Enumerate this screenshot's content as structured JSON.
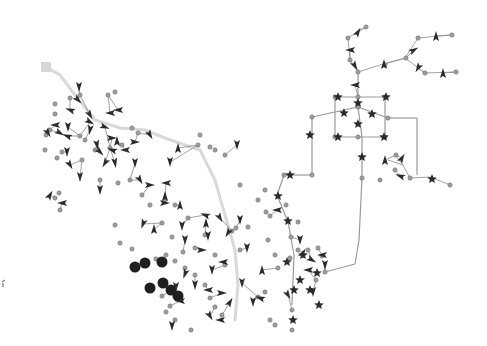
{
  "diagram": {
    "type": "network-graph",
    "background": "#ffffff",
    "colors": {
      "trunk": "#d9d9d9",
      "edge": "#8a8a8a",
      "junction": "#9c9c9c",
      "marker": "#2b2b2b",
      "root": "#d6d6d6"
    },
    "root": {
      "shape": "square",
      "x": 46,
      "y": 67,
      "size": 10
    },
    "trunks": [
      [
        [
          46,
          67
        ],
        [
          60,
          75
        ],
        [
          75,
          95
        ],
        [
          95,
          120
        ],
        [
          120,
          128
        ],
        [
          145,
          130
        ],
        [
          165,
          138
        ],
        [
          185,
          145
        ],
        [
          200,
          150
        ]
      ],
      [
        [
          200,
          150
        ],
        [
          215,
          180
        ],
        [
          225,
          215
        ],
        [
          235,
          250
        ],
        [
          238,
          285
        ],
        [
          235,
          320
        ]
      ]
    ],
    "grid_edges": [
      [
        [
          358,
          72
        ],
        [
          358,
          97
        ]
      ],
      [
        [
          335,
          97
        ],
        [
          385,
          97
        ]
      ],
      [
        [
          335,
          97
        ],
        [
          335,
          137
        ]
      ],
      [
        [
          385,
          97
        ],
        [
          385,
          137
        ]
      ],
      [
        [
          335,
          137
        ],
        [
          385,
          137
        ]
      ],
      [
        [
          312,
          117
        ],
        [
          358,
          107
        ]
      ],
      [
        [
          358,
          107
        ],
        [
          388,
          118
        ]
      ],
      [
        [
          312,
          117
        ],
        [
          312,
          175
        ]
      ],
      [
        [
          388,
          118
        ],
        [
          417,
          118
        ]
      ],
      [
        [
          417,
          118
        ],
        [
          417,
          175
        ]
      ],
      [
        [
          358,
          107
        ],
        [
          362,
          137
        ]
      ],
      [
        [
          362,
          137
        ],
        [
          362,
          178
        ]
      ],
      [
        [
          362,
          178
        ],
        [
          359,
          240
        ]
      ],
      [
        [
          359,
          240
        ],
        [
          355,
          264
        ]
      ],
      [
        [
          355,
          264
        ],
        [
          325,
          272
        ]
      ],
      [
        [
          312,
          175
        ],
        [
          284,
          175
        ]
      ],
      [
        [
          284,
          175
        ],
        [
          277,
          195
        ]
      ],
      [
        [
          277,
          195
        ],
        [
          288,
          222
        ]
      ],
      [
        [
          288,
          222
        ],
        [
          294,
          255
        ]
      ],
      [
        [
          294,
          255
        ],
        [
          292,
          305
        ]
      ]
    ],
    "tree_edges": [
      [
        [
          358,
          72
        ],
        [
          350,
          60
        ]
      ],
      [
        [
          350,
          60
        ],
        [
          348,
          38
        ]
      ],
      [
        [
          348,
          38
        ],
        [
          365,
          27
        ]
      ],
      [
        [
          358,
          72
        ],
        [
          380,
          65
        ]
      ],
      [
        [
          380,
          65
        ],
        [
          405,
          58
        ]
      ],
      [
        [
          405,
          58
        ],
        [
          418,
          38
        ]
      ],
      [
        [
          418,
          38
        ],
        [
          450,
          35
        ]
      ],
      [
        [
          405,
          58
        ],
        [
          425,
          73
        ]
      ],
      [
        [
          425,
          73
        ],
        [
          456,
          72
        ]
      ],
      [
        [
          395,
          155
        ],
        [
          403,
          165
        ]
      ],
      [
        [
          403,
          165
        ],
        [
          410,
          178
        ]
      ],
      [
        [
          410,
          178
        ],
        [
          430,
          177
        ]
      ],
      [
        [
          430,
          177
        ],
        [
          450,
          185
        ]
      ],
      [
        [
          403,
          165
        ],
        [
          388,
          160
        ]
      ]
    ],
    "stars": [
      [
        338,
        97
      ],
      [
        386,
        97
      ],
      [
        358,
        103
      ],
      [
        344,
        113
      ],
      [
        372,
        114
      ],
      [
        358,
        124
      ],
      [
        310,
        135
      ],
      [
        338,
        137
      ],
      [
        384,
        137
      ],
      [
        362,
        157
      ],
      [
        290,
        175
      ],
      [
        278,
        196
      ],
      [
        288,
        221
      ],
      [
        287,
        262
      ],
      [
        294,
        290
      ],
      [
        300,
        280
      ],
      [
        310,
        290
      ],
      [
        319,
        305
      ],
      [
        293,
        320
      ],
      [
        303,
        255
      ],
      [
        317,
        273
      ],
      [
        432,
        179
      ]
    ],
    "junctions": [
      [
        350,
        60
      ],
      [
        348,
        38
      ],
      [
        366,
        27
      ],
      [
        385,
        65
      ],
      [
        406,
        58
      ],
      [
        418,
        38
      ],
      [
        452,
        35
      ],
      [
        425,
        73
      ],
      [
        456,
        72
      ],
      [
        358,
        72
      ],
      [
        358,
        97
      ],
      [
        335,
        97
      ],
      [
        385,
        97
      ],
      [
        312,
        117
      ],
      [
        358,
        107
      ],
      [
        388,
        118
      ],
      [
        358,
        137
      ],
      [
        335,
        137
      ],
      [
        385,
        137
      ],
      [
        362,
        178
      ],
      [
        312,
        175
      ],
      [
        284,
        175
      ],
      [
        286,
        205
      ],
      [
        298,
        222
      ],
      [
        291,
        237
      ],
      [
        298,
        250
      ],
      [
        290,
        258
      ],
      [
        292,
        310
      ],
      [
        292,
        330
      ],
      [
        308,
        250
      ],
      [
        318,
        248
      ],
      [
        322,
        256
      ],
      [
        316,
        280
      ],
      [
        325,
        272
      ],
      [
        380,
        180
      ],
      [
        410,
        178
      ],
      [
        450,
        185
      ],
      [
        396,
        155
      ],
      [
        395,
        170
      ],
      [
        70,
        98
      ],
      [
        55,
        104
      ],
      [
        55,
        114
      ],
      [
        50,
        130
      ],
      [
        46,
        135
      ],
      [
        45,
        150
      ],
      [
        57,
        158
      ],
      [
        62,
        152
      ],
      [
        80,
        95
      ],
      [
        108,
        95
      ],
      [
        115,
        92
      ],
      [
        80,
        136
      ],
      [
        85,
        140
      ],
      [
        82,
        160
      ],
      [
        95,
        150
      ],
      [
        110,
        148
      ],
      [
        122,
        145
      ],
      [
        132,
        128
      ],
      [
        138,
        133
      ],
      [
        210,
        147
      ],
      [
        198,
        145
      ],
      [
        215,
        150
      ],
      [
        200,
        135
      ],
      [
        225,
        155
      ],
      [
        240,
        185
      ],
      [
        265,
        190
      ],
      [
        258,
        200
      ],
      [
        266,
        212
      ],
      [
        270,
        216
      ],
      [
        268,
        240
      ],
      [
        275,
        255
      ],
      [
        278,
        268
      ],
      [
        265,
        292
      ],
      [
        258,
        297
      ],
      [
        270,
        320
      ],
      [
        275,
        325
      ],
      [
        248,
        227
      ],
      [
        236,
        228
      ],
      [
        232,
        231
      ],
      [
        240,
        250
      ],
      [
        210,
        298
      ],
      [
        162,
        223
      ],
      [
        162,
        296
      ],
      [
        115,
        225
      ],
      [
        120,
        243
      ],
      [
        132,
        249
      ],
      [
        156,
        259
      ],
      [
        166,
        255
      ],
      [
        175,
        261
      ],
      [
        185,
        268
      ],
      [
        195,
        248
      ],
      [
        205,
        235
      ],
      [
        215,
        255
      ],
      [
        225,
        265
      ],
      [
        55,
        198
      ],
      [
        60,
        210
      ],
      [
        59,
        193
      ],
      [
        100,
        180
      ],
      [
        118,
        183
      ],
      [
        130,
        180
      ],
      [
        142,
        195
      ],
      [
        150,
        205
      ],
      [
        165,
        200
      ],
      [
        175,
        205
      ],
      [
        188,
        218
      ],
      [
        172,
        237
      ],
      [
        183,
        252
      ],
      [
        195,
        275
      ],
      [
        205,
        285
      ],
      [
        215,
        307
      ],
      [
        222,
        315
      ],
      [
        166,
        312
      ],
      [
        170,
        306
      ],
      [
        175,
        320
      ],
      [
        191,
        330
      ]
    ],
    "triangles": [
      {
        "x": 79,
        "y": 87,
        "r": 90
      },
      {
        "x": 78,
        "y": 100,
        "r": 45
      },
      {
        "x": 70,
        "y": 110,
        "r": 200
      },
      {
        "x": 90,
        "y": 115,
        "r": 60
      },
      {
        "x": 90,
        "y": 122,
        "r": 30
      },
      {
        "x": 110,
        "y": 113,
        "r": 180
      },
      {
        "x": 118,
        "y": 110,
        "r": 180
      },
      {
        "x": 55,
        "y": 125,
        "r": 180
      },
      {
        "x": 68,
        "y": 127,
        "r": 90
      },
      {
        "x": 48,
        "y": 133,
        "r": 60
      },
      {
        "x": 60,
        "y": 133,
        "r": 30
      },
      {
        "x": 67,
        "y": 136,
        "r": 200
      },
      {
        "x": 90,
        "y": 130,
        "r": 100
      },
      {
        "x": 105,
        "y": 127,
        "r": 20
      },
      {
        "x": 112,
        "y": 138,
        "r": 0
      },
      {
        "x": 117,
        "y": 141,
        "r": 270
      },
      {
        "x": 97,
        "y": 145,
        "r": 80
      },
      {
        "x": 67,
        "y": 152,
        "r": 90
      },
      {
        "x": 100,
        "y": 152,
        "r": 45
      },
      {
        "x": 112,
        "y": 150,
        "r": 200
      },
      {
        "x": 125,
        "y": 150,
        "r": 180
      },
      {
        "x": 135,
        "y": 142,
        "r": 0
      },
      {
        "x": 105,
        "y": 163,
        "r": 120
      },
      {
        "x": 115,
        "y": 163,
        "r": 80
      },
      {
        "x": 70,
        "y": 165,
        "r": 60
      },
      {
        "x": 135,
        "y": 163,
        "r": 90
      },
      {
        "x": 150,
        "y": 135,
        "r": 60
      },
      {
        "x": 178,
        "y": 148,
        "r": 270
      },
      {
        "x": 170,
        "y": 162,
        "r": 90
      },
      {
        "x": 237,
        "y": 145,
        "r": 90
      },
      {
        "x": 50,
        "y": 195,
        "r": 300
      },
      {
        "x": 62,
        "y": 203,
        "r": 180
      },
      {
        "x": 80,
        "y": 177,
        "r": 90
      },
      {
        "x": 100,
        "y": 190,
        "r": 90
      },
      {
        "x": 140,
        "y": 180,
        "r": 60
      },
      {
        "x": 150,
        "y": 185,
        "r": 0
      },
      {
        "x": 166,
        "y": 183,
        "r": 180
      },
      {
        "x": 165,
        "y": 196,
        "r": 270
      },
      {
        "x": 143,
        "y": 224,
        "r": 110
      },
      {
        "x": 154,
        "y": 229,
        "r": 270
      },
      {
        "x": 165,
        "y": 203,
        "r": 0
      },
      {
        "x": 180,
        "y": 205,
        "r": 270
      },
      {
        "x": 182,
        "y": 226,
        "r": 90
      },
      {
        "x": 185,
        "y": 240,
        "r": 90
      },
      {
        "x": 205,
        "y": 215,
        "r": 200
      },
      {
        "x": 206,
        "y": 223,
        "r": 270
      },
      {
        "x": 208,
        "y": 236,
        "r": 90
      },
      {
        "x": 220,
        "y": 218,
        "r": 60
      },
      {
        "x": 228,
        "y": 233,
        "r": 120
      },
      {
        "x": 202,
        "y": 250,
        "r": 0
      },
      {
        "x": 212,
        "y": 270,
        "r": 90
      },
      {
        "x": 223,
        "y": 262,
        "r": 180
      },
      {
        "x": 222,
        "y": 293,
        "r": 0
      },
      {
        "x": 230,
        "y": 302,
        "r": 300
      },
      {
        "x": 242,
        "y": 283,
        "r": 90
      },
      {
        "x": 210,
        "y": 316,
        "r": 60
      },
      {
        "x": 220,
        "y": 320,
        "r": 180
      },
      {
        "x": 172,
        "y": 326,
        "r": 90
      },
      {
        "x": 180,
        "y": 301,
        "r": 180
      },
      {
        "x": 185,
        "y": 274,
        "r": 110
      },
      {
        "x": 195,
        "y": 285,
        "r": 90
      },
      {
        "x": 208,
        "y": 290,
        "r": 180
      },
      {
        "x": 176,
        "y": 287,
        "r": 90
      },
      {
        "x": 240,
        "y": 220,
        "r": 90
      },
      {
        "x": 247,
        "y": 248,
        "r": 90
      },
      {
        "x": 262,
        "y": 270,
        "r": 270
      },
      {
        "x": 260,
        "y": 298,
        "r": 200
      },
      {
        "x": 253,
        "y": 302,
        "r": 90
      },
      {
        "x": 277,
        "y": 210,
        "r": 180
      },
      {
        "x": 300,
        "y": 240,
        "r": 90
      },
      {
        "x": 303,
        "y": 253,
        "r": 300
      },
      {
        "x": 312,
        "y": 260,
        "r": 30
      },
      {
        "x": 322,
        "y": 255,
        "r": 180
      },
      {
        "x": 308,
        "y": 270,
        "r": 180
      },
      {
        "x": 325,
        "y": 265,
        "r": 90
      },
      {
        "x": 288,
        "y": 295,
        "r": 60
      },
      {
        "x": 313,
        "y": 292,
        "r": 90
      },
      {
        "x": 355,
        "y": 85,
        "r": 180
      },
      {
        "x": 355,
        "y": 66,
        "r": 60
      },
      {
        "x": 350,
        "y": 50,
        "r": 180
      },
      {
        "x": 358,
        "y": 32,
        "r": 300
      },
      {
        "x": 384,
        "y": 64,
        "r": 270
      },
      {
        "x": 414,
        "y": 50,
        "r": 330
      },
      {
        "x": 436,
        "y": 36,
        "r": 270
      },
      {
        "x": 418,
        "y": 68,
        "r": 120
      },
      {
        "x": 443,
        "y": 73,
        "r": 270
      },
      {
        "x": 385,
        "y": 160,
        "r": 270
      },
      {
        "x": 402,
        "y": 158,
        "r": 300
      },
      {
        "x": 400,
        "y": 176,
        "r": 200
      }
    ],
    "big_circles": [
      [
        135,
        267
      ],
      [
        145,
        263
      ],
      [
        162,
        262
      ],
      [
        150,
        288
      ],
      [
        163,
        283
      ],
      [
        171,
        290
      ],
      [
        178,
        296
      ]
    ],
    "stray_mark": {
      "x": 2,
      "y": 282,
      "label": "partial-node-edge"
    }
  }
}
